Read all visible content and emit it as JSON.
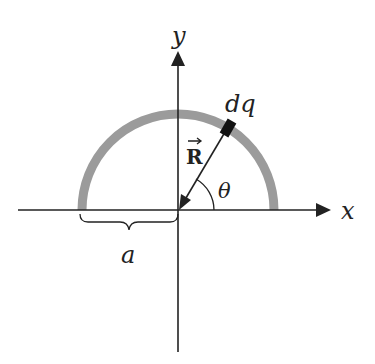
{
  "diagram": {
    "labels": {
      "y_axis": "y",
      "x_axis": "x",
      "charge_element": "dq",
      "position_vector": "R",
      "angle": "θ",
      "radius": "a"
    },
    "colors": {
      "arc": "#9b9b9b",
      "axes": "#222222",
      "charge_element": "#111111",
      "text": "#222222"
    },
    "angle_deg": 60
  }
}
